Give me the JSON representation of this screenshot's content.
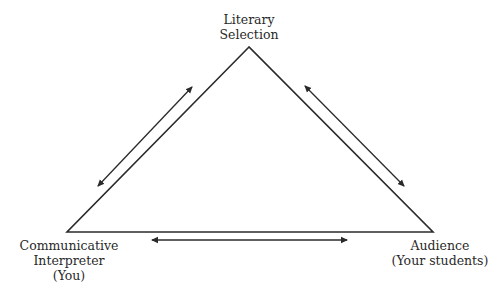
{
  "diagram": {
    "nodes": {
      "top": {
        "lines": [
          "Literary",
          "Selection"
        ]
      },
      "left": {
        "lines": [
          "Communicative",
          "Interpreter",
          "(You)"
        ]
      },
      "right": {
        "lines": [
          "Audience",
          "(Your students)"
        ]
      }
    },
    "edges": [
      {
        "from": "left",
        "to": "top",
        "type": "bidirectional-arrow"
      },
      {
        "from": "top",
        "to": "right",
        "type": "bidirectional-arrow"
      },
      {
        "from": "left",
        "to": "right",
        "type": "bidirectional-arrow"
      }
    ],
    "colors": {
      "line": "#2a2a2a",
      "background": "#ffffff"
    }
  }
}
